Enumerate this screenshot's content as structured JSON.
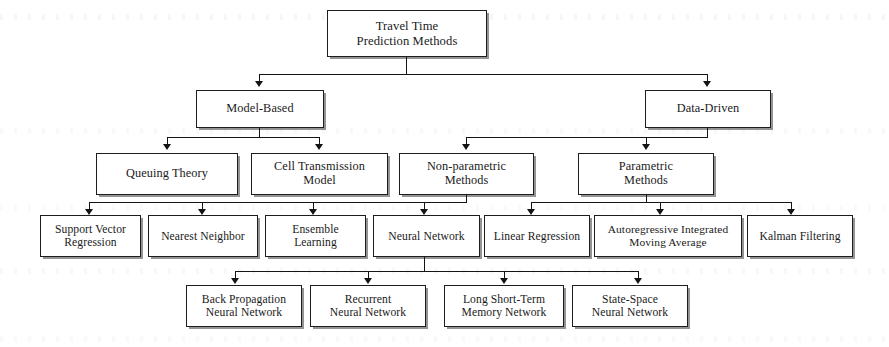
{
  "diagram": {
    "title": "Travel Time Prediction Methods",
    "type": "hierarchy-tree",
    "levels": 5,
    "colors": {
      "box_border": "#1d1d1d",
      "box_fill": "#ffffff",
      "connector": "#141414",
      "shadow": "rgba(60,60,60,0.55)",
      "text": "#1a1a1a"
    },
    "nodes": {
      "root": "Travel Time\nPrediction Methods",
      "model_based": "Model-Based",
      "data_driven": "Data-Driven",
      "queuing_theory": "Queuing Theory",
      "cell_transmission_model": "Cell Transmission\nModel",
      "non_parametric_methods": "Non-parametric\nMethods",
      "parametric_methods": "Parametric\nMethods",
      "support_vector_regression": "Support Vector\nRegression",
      "nearest_neighbor": "Nearest Neighbor",
      "ensemble_learning": "Ensemble\nLearning",
      "neural_network": "Neural Network",
      "linear_regression": "Linear Regression",
      "arima": "Autoregressive Integrated\nMoving Average",
      "kalman_filtering": "Kalman Filtering",
      "back_propagation_neural_network": "Back Propagation\nNeural Network",
      "recurrent_neural_network": "Recurrent\nNeural Network",
      "long_short_term_memory_network": "Long Short-Term\nMemory Network",
      "state_space_neural_network": "State-Space\nNeural Network"
    },
    "edges": [
      {
        "from": "root",
        "to": "model_based"
      },
      {
        "from": "root",
        "to": "data_driven"
      },
      {
        "from": "model_based",
        "to": "queuing_theory"
      },
      {
        "from": "model_based",
        "to": "cell_transmission_model"
      },
      {
        "from": "data_driven",
        "to": "non_parametric_methods"
      },
      {
        "from": "data_driven",
        "to": "parametric_methods"
      },
      {
        "from": "non_parametric_methods",
        "to": "support_vector_regression"
      },
      {
        "from": "non_parametric_methods",
        "to": "nearest_neighbor"
      },
      {
        "from": "non_parametric_methods",
        "to": "ensemble_learning"
      },
      {
        "from": "non_parametric_methods",
        "to": "neural_network"
      },
      {
        "from": "parametric_methods",
        "to": "linear_regression"
      },
      {
        "from": "parametric_methods",
        "to": "arima"
      },
      {
        "from": "parametric_methods",
        "to": "kalman_filtering"
      },
      {
        "from": "neural_network",
        "to": "back_propagation_neural_network"
      },
      {
        "from": "neural_network",
        "to": "recurrent_neural_network"
      },
      {
        "from": "neural_network",
        "to": "long_short_term_memory_network"
      },
      {
        "from": "neural_network",
        "to": "state_space_neural_network"
      }
    ]
  }
}
